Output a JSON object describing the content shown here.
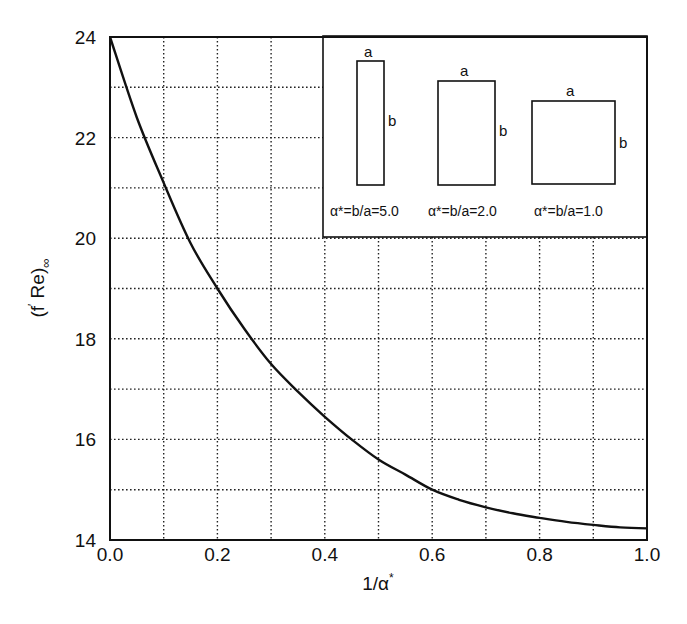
{
  "chart_data": {
    "type": "line",
    "title": "",
    "xlabel": "1/α*",
    "ylabel": "(f Re)∞",
    "xlim": [
      0.0,
      1.0
    ],
    "ylim": [
      14,
      24
    ],
    "grid": true,
    "grid_style": "dotted",
    "x_ticks": [
      0.0,
      0.2,
      0.4,
      0.6,
      0.8,
      1.0
    ],
    "x_tick_labels": [
      "0.0",
      "0.2",
      "0.4",
      "0.6",
      "0.8",
      "1.0"
    ],
    "x_grid_step": 0.1,
    "y_ticks": [
      14,
      16,
      18,
      20,
      22,
      24
    ],
    "y_tick_labels": [
      "14",
      "16",
      "18",
      "20",
      "22",
      "24"
    ],
    "y_grid_step": 1,
    "series": [
      {
        "name": "fully developed (f Re) for rectangular ducts",
        "color": "#111111",
        "x": [
          0.0,
          0.05,
          0.1,
          0.15,
          0.2,
          0.25,
          0.3,
          0.35,
          0.4,
          0.45,
          0.5,
          0.55,
          0.6,
          0.65,
          0.7,
          0.75,
          0.8,
          0.85,
          0.9,
          0.95,
          1.0
        ],
        "y": [
          24.0,
          22.4,
          21.1,
          19.9,
          19.0,
          18.2,
          17.5,
          16.95,
          16.45,
          16.0,
          15.6,
          15.3,
          15.0,
          14.8,
          14.65,
          14.53,
          14.44,
          14.36,
          14.3,
          14.25,
          14.23
        ]
      }
    ],
    "legend": {
      "position": "upper right (inset)",
      "entries": [
        {
          "label": "α*=b/a=5.0",
          "side_a": "a",
          "side_b": "b",
          "aspect": 5.0
        },
        {
          "label": "α*=b/a=2.0",
          "side_a": "a",
          "side_b": "b",
          "aspect": 2.0
        },
        {
          "label": "α*=b/a=1.0",
          "side_a": "a",
          "side_b": "b",
          "aspect": 1.0
        }
      ]
    }
  },
  "axes": {
    "x_title": "1/α",
    "x_title_sup": "*",
    "y_title_main": "(f",
    "y_title_prime": "′",
    "y_title_rest": " Re)",
    "y_title_sub": "∞"
  }
}
